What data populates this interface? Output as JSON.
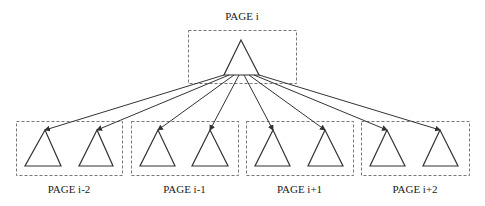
{
  "diagram": {
    "parent": {
      "label": "PAGE i",
      "box": [
        188,
        30,
        108,
        53
      ],
      "triangle": {
        "apex": [
          241,
          40
        ],
        "base": [
          224,
          259,
          75
        ]
      }
    },
    "children": [
      {
        "label": "PAGE i-2",
        "box": [
          16,
          121,
          106,
          54
        ],
        "triangles": [
          {
            "apex": [
              45,
              130
            ],
            "base": [
              25,
              61,
              166
            ]
          },
          {
            "apex": [
              97,
              130
            ],
            "base": [
              79,
              113,
              166
            ]
          }
        ]
      },
      {
        "label": "PAGE i-1",
        "box": [
          131,
          121,
          107,
          54
        ],
        "triangles": [
          {
            "apex": [
              158,
              130
            ],
            "base": [
              140,
              175,
              166
            ]
          },
          {
            "apex": [
              210,
              130
            ],
            "base": [
              192,
              228,
              166
            ]
          }
        ]
      },
      {
        "label": "PAGE i+1",
        "box": [
          246,
          121,
          107,
          54
        ],
        "triangles": [
          {
            "apex": [
              273,
              130
            ],
            "base": [
              255,
              290,
              166
            ]
          },
          {
            "apex": [
              325,
              130
            ],
            "base": [
              308,
              343,
              166
            ]
          }
        ]
      },
      {
        "label": "PAGE i+2",
        "box": [
          361,
          121,
          108,
          54
        ],
        "triangles": [
          {
            "apex": [
              387,
              130
            ],
            "base": [
              370,
              405,
              166
            ]
          },
          {
            "apex": [
              440,
              130
            ],
            "base": [
              423,
              458,
              166
            ]
          }
        ]
      }
    ],
    "edge_origin_y": 75,
    "colors": {
      "stroke": "#333333",
      "dash": "#777777"
    }
  }
}
